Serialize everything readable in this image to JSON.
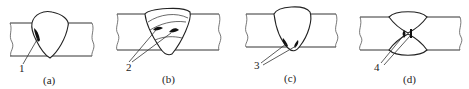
{
  "figure": {
    "panels": [
      {
        "id": "a",
        "caption": "(a)",
        "callout": "1",
        "defect_count": 1
      },
      {
        "id": "b",
        "caption": "(b)",
        "callout": "2",
        "defect_count": 2
      },
      {
        "id": "c",
        "caption": "(c)",
        "callout": "3",
        "defect_count": 2
      },
      {
        "id": "d",
        "caption": "(d)",
        "callout": "4",
        "defect_count": 2
      }
    ],
    "colors": {
      "line": "#333333",
      "defect": "#111111",
      "background": "#ffffff"
    }
  }
}
